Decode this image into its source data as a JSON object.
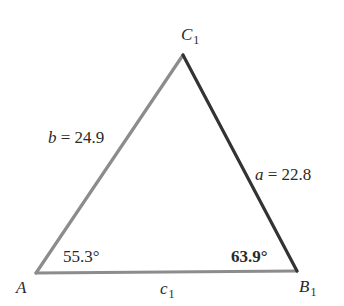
{
  "diagram": {
    "type": "triangle",
    "vertices": {
      "A": {
        "label_main": "A",
        "label_sub": ""
      },
      "B1": {
        "label_main": "B",
        "label_sub": "1"
      },
      "C1": {
        "label_main": "C",
        "label_sub": "1"
      }
    },
    "sides": {
      "a": {
        "var": "a",
        "eq": " = 22.8",
        "value": 22.8,
        "color": "#333333"
      },
      "b": {
        "var": "b",
        "eq": " = 24.9",
        "value": 24.9,
        "color": "#8c8c8c"
      },
      "c1": {
        "var": "c",
        "sub": "1",
        "color": "#8c8c8c"
      }
    },
    "angles": {
      "A": {
        "text": "55.3°",
        "value": 55.3
      },
      "B1": {
        "text": "63.9°",
        "value": 63.9,
        "bold": true
      }
    }
  }
}
